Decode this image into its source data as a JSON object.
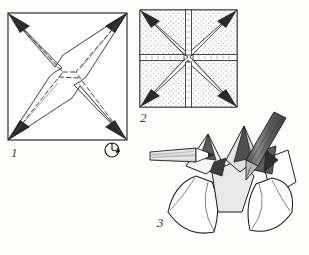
{
  "diagram": {
    "kind": "origami-instruction-diagram",
    "background_color": "#fdfdfc",
    "ink_color": "#1c1c1c",
    "shade_dark": "#5a5a5a",
    "shade_mid": "#9a9a9a",
    "shade_light": "#e4e4e4",
    "stipple_color": "#8d8d8d"
  },
  "steps": [
    {
      "number": "1",
      "label": "1",
      "caption": "Square sheet with diagonal creases and pinched star-shaped center",
      "has_dashed_fold_lines": true,
      "shape": "square",
      "bounds": {
        "x": 8,
        "y": 13,
        "width": 119,
        "height": 127
      }
    },
    {
      "number": "2",
      "label": "2",
      "caption": "Collapsed square with stippled shading and cross-shaped opening",
      "has_dashed_fold_lines": false,
      "shape": "square",
      "bounds": {
        "x": 140,
        "y": 10,
        "width": 97,
        "height": 97
      }
    },
    {
      "number": "3",
      "label": "3",
      "caption": "Finished three-dimensional form with two pencils inserted",
      "has_dashed_fold_lines": false,
      "shape": "three-dimensional",
      "bounds": {
        "x": 110,
        "y": 110,
        "width": 190,
        "height": 130
      }
    }
  ],
  "symbols": [
    {
      "name": "rotate-arrow",
      "label": "rotate",
      "position": {
        "x": 112,
        "y": 150
      },
      "radius": 7
    }
  ],
  "tools": [
    {
      "name": "pencil-horizontal",
      "label": "pencil",
      "orientation": "horizontal",
      "body_color": "#d2d2d2",
      "tip_color": "#ffffff"
    },
    {
      "name": "pencil-diagonal",
      "label": "pencil",
      "orientation": "diagonal",
      "body_color": "#6e6e6e",
      "tip_color": "#bdbdbd"
    }
  ]
}
